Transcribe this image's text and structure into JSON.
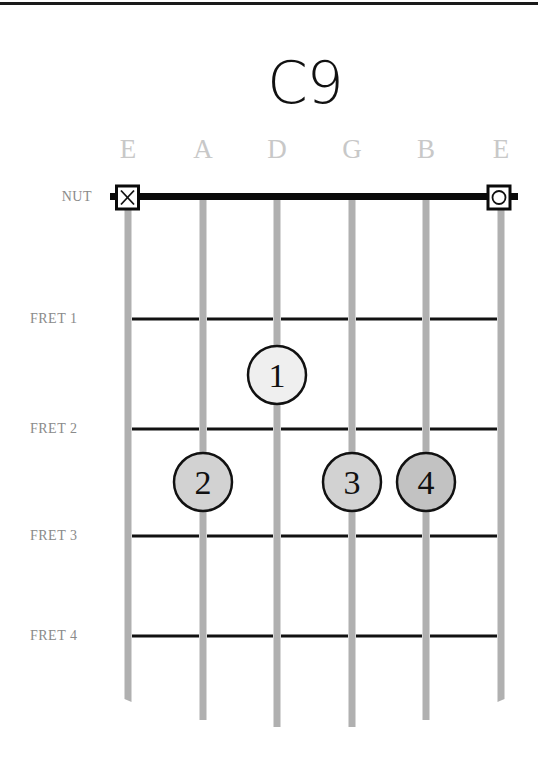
{
  "chord": {
    "name": "C9"
  },
  "strings": [
    {
      "name": "E",
      "x": 128,
      "end_y": 702
    },
    {
      "name": "A",
      "x": 203,
      "end_y": 720
    },
    {
      "name": "D",
      "x": 277,
      "end_y": 727
    },
    {
      "name": "G",
      "x": 352,
      "end_y": 727
    },
    {
      "name": "B",
      "x": 426,
      "end_y": 720
    },
    {
      "name": "E",
      "x": 501,
      "end_y": 702
    }
  ],
  "labels": {
    "nut": "NUT",
    "frets": [
      "FRET 1",
      "FRET 2",
      "FRET 3",
      "FRET 4"
    ]
  },
  "fret_y": [
    319,
    429,
    536,
    636
  ],
  "nut_markers": [
    {
      "string": 1,
      "type": "muted",
      "symbol": "X"
    },
    {
      "string": 6,
      "type": "open",
      "symbol": "O"
    }
  ],
  "fingers": [
    {
      "finger": "1",
      "string": 3,
      "fret": 1,
      "cx": 277,
      "cy": 375,
      "fill": "#efefef"
    },
    {
      "finger": "2",
      "string": 2,
      "fret": 2,
      "cx": 203,
      "cy": 482,
      "fill": "#d2d2d2"
    },
    {
      "finger": "3",
      "string": 4,
      "fret": 2,
      "cx": 352,
      "cy": 482,
      "fill": "#d2d2d2"
    },
    {
      "finger": "4",
      "string": 5,
      "fret": 2,
      "cx": 426,
      "cy": 482,
      "fill": "#c2c2c2"
    }
  ],
  "colors": {
    "string": "#b0b0b0",
    "fret": "#111111",
    "nut": "#0a0a0a",
    "label": "#8a8a8a",
    "string_name": "#c8c8c8"
  }
}
